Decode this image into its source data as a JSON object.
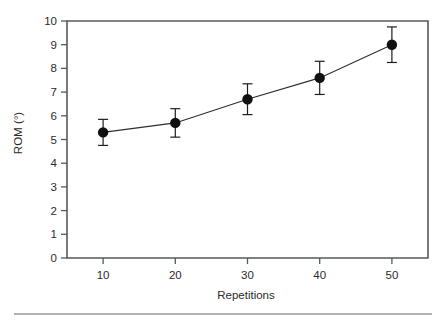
{
  "chart_data": {
    "type": "line",
    "title": "",
    "subtitle": "",
    "xlabel": "Repetitions",
    "ylabel": "ROM (°)",
    "x": [
      10,
      20,
      30,
      40,
      50
    ],
    "values": [
      5.3,
      5.7,
      6.7,
      7.6,
      9.0
    ],
    "error_upper": [
      0.55,
      0.6,
      0.65,
      0.7,
      0.75
    ],
    "error_lower": [
      0.55,
      0.6,
      0.65,
      0.7,
      0.75
    ],
    "series": [
      {
        "name": "ROM",
        "values": [
          5.3,
          5.7,
          6.7,
          7.6,
          9.0
        ],
        "errors": [
          0.55,
          0.6,
          0.65,
          0.7,
          0.75
        ]
      }
    ],
    "xtick_labels": [
      "10",
      "20",
      "30",
      "40",
      "50"
    ],
    "ytick_labels": [
      "0",
      "1",
      "2",
      "3",
      "4",
      "5",
      "6",
      "7",
      "8",
      "9",
      "10"
    ],
    "xlim": [
      5,
      55
    ],
    "ylim": [
      0,
      10
    ],
    "grid": false,
    "legend": null,
    "legend_position": "none",
    "marker": "filled-circle",
    "errorbar_style": "capped",
    "frame": "box",
    "colors": {
      "line": "#2e2e2e",
      "marker": "#111111",
      "errorbar": "#1d1d1d",
      "frame": "#555a5e",
      "text": "#2b2b2b",
      "background": "#ffffff",
      "rule": "#9a9a9a"
    }
  },
  "footer": {
    "rule_present": true
  }
}
